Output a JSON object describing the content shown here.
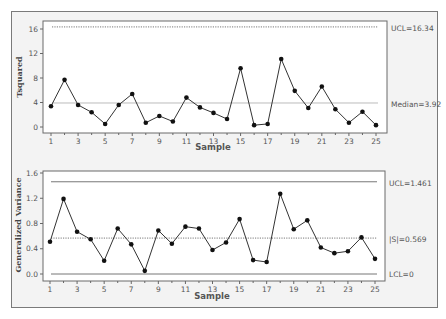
{
  "chart_data": [
    {
      "type": "line",
      "title": "",
      "xlabel": "Sample",
      "ylabel": "Tsquared",
      "x": [
        1,
        2,
        3,
        4,
        5,
        6,
        7,
        8,
        9,
        10,
        11,
        12,
        13,
        14,
        15,
        16,
        17,
        18,
        19,
        20,
        21,
        22,
        23,
        24,
        25
      ],
      "values": [
        3.4,
        7.7,
        3.6,
        2.4,
        0.5,
        3.6,
        5.4,
        0.7,
        1.8,
        0.9,
        4.8,
        3.2,
        2.3,
        1.3,
        9.6,
        0.3,
        0.5,
        11.1,
        5.9,
        3.1,
        6.6,
        2.9,
        0.7,
        2.5,
        0.3
      ],
      "x_ticks": [
        "1",
        "3",
        "5",
        "7",
        "9",
        "11",
        "13",
        "15",
        "17",
        "19",
        "21",
        "23",
        "25"
      ],
      "y_ticks": [
        "0",
        "4",
        "8",
        "12",
        "16"
      ],
      "ylim": [
        -1,
        17.5
      ],
      "reference_lines": [
        {
          "label": "UCL=16.34",
          "value": 16.34,
          "style": "dotted"
        },
        {
          "label": "Median=3.92",
          "value": 3.92,
          "style": "solid-light"
        }
      ],
      "grid": false
    },
    {
      "type": "line",
      "title": "",
      "xlabel": "Sample",
      "ylabel": "Generalized Variance",
      "x": [
        1,
        2,
        3,
        4,
        5,
        6,
        7,
        8,
        9,
        10,
        11,
        12,
        13,
        14,
        15,
        16,
        17,
        18,
        19,
        20,
        21,
        22,
        23,
        24,
        25
      ],
      "values": [
        0.51,
        1.19,
        0.67,
        0.55,
        0.21,
        0.72,
        0.47,
        0.05,
        0.69,
        0.48,
        0.75,
        0.72,
        0.38,
        0.5,
        0.87,
        0.22,
        0.19,
        1.27,
        0.71,
        0.85,
        0.42,
        0.33,
        0.36,
        0.58,
        0.24
      ],
      "x_ticks": [
        "1",
        "3",
        "5",
        "7",
        "9",
        "11",
        "13",
        "15",
        "17",
        "19",
        "21",
        "23",
        "25"
      ],
      "y_ticks": [
        "0.0",
        "0.4",
        "0.8",
        "1.2",
        "1.6"
      ],
      "ylim": [
        -0.1,
        1.62
      ],
      "reference_lines": [
        {
          "label": "UCL=1.461",
          "value": 1.461,
          "style": "solid"
        },
        {
          "label": "|S|=0.569",
          "value": 0.569,
          "style": "dotted"
        },
        {
          "label": "LCL=0",
          "value": 0,
          "style": "solid"
        }
      ],
      "grid": false
    }
  ],
  "labels": {
    "top_ylabel": "Tsquared",
    "bottom_ylabel": "Generalized Variance",
    "xlabel": "Sample",
    "top_ucl": "UCL=16.34",
    "top_median": "Median=3.92",
    "bottom_ucl": "UCL=1.461",
    "bottom_center": "|S|=0.569",
    "bottom_lcl": "LCL=0"
  }
}
